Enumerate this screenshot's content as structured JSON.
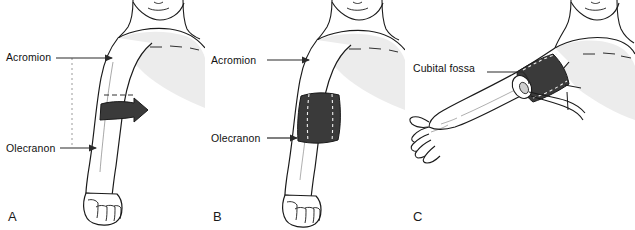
{
  "figure": {
    "background_color": "#ffffff",
    "panel_count": 3
  },
  "colors": {
    "outline": "#1a1a1a",
    "skin_fill": "#ffffff",
    "body_shading": "#ececec",
    "arm_shading": "#f2f2f2",
    "cuff_dark": "#3a3a3a",
    "cuff_highlight": "#5a5a5a",
    "stitch_white": "#f0f0f0",
    "label_text": "#111111",
    "leader_line": "#2b2b2b",
    "dotted_guide": "#9a9a9a"
  },
  "panels": [
    {
      "id": "A",
      "letter": "A",
      "description": "Arm with cuff band wrapping around upper arm, arrow showing wrap direction, dotted vertical guide between acromion and olecranon levels",
      "hand_position": "clenched fist",
      "cuff_style": "band with directional arrow",
      "labels": [
        {
          "name": "acromion",
          "text": "Acromion",
          "pointer": "arrow"
        },
        {
          "name": "olecranon",
          "text": "Olecranon",
          "pointer": "arrow"
        }
      ],
      "guides": [
        {
          "name": "midpoint-dotted-line",
          "style": "dotted-vertical"
        },
        {
          "name": "cuff-upper-edge-dashes",
          "style": "dashed-horizontal"
        }
      ]
    },
    {
      "id": "B",
      "letter": "B",
      "description": "Arm with blood pressure cuff fully wrapped around upper arm showing stitched seams",
      "hand_position": "clenched fist",
      "cuff_style": "wrapped cuff with dashed stitching",
      "labels": [
        {
          "name": "acromion",
          "text": "Acromion",
          "pointer": "arrow"
        },
        {
          "name": "olecranon",
          "text": "Olecranon",
          "pointer": "arrow"
        }
      ],
      "guides": []
    },
    {
      "id": "C",
      "letter": "C",
      "description": "Extended arm with open hand, cuff on upper arm with tubing emerging, cubital fossa indicated by leader line",
      "hand_position": "open hand, palm up",
      "cuff_style": "wrapped cuff with tubing",
      "labels": [
        {
          "name": "cubital-fossa",
          "text": "Cubital fossa",
          "pointer": "leader-line"
        }
      ],
      "guides": []
    }
  ]
}
